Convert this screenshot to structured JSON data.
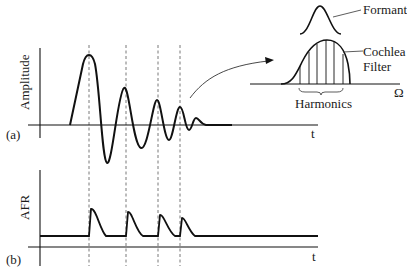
{
  "panels": {
    "a": {
      "tag": "(a)",
      "ylabel": "Amplitude",
      "xlabel": "t",
      "description": "Damped oscillating waveform (decaying sinusoid)"
    },
    "b": {
      "tag": "(b)",
      "ylabel": "AFR",
      "xlabel": "t",
      "description": "Pulse train of decaying spikes aligned with waveform peaks"
    }
  },
  "inset": {
    "formant_label": "Formant",
    "cochlea_label_line1": "Cochlea",
    "cochlea_label_line2": "Filter",
    "harmonics_label": "Harmonics",
    "axis_label": "Ω",
    "harmonic_line_count": 6
  },
  "guides": {
    "dashed_line_count": 4,
    "style": "dashed vertical lines linking waveform peaks to AFR pulses"
  },
  "colors": {
    "stroke": "#111111",
    "dashed": "#555555",
    "background": "#ffffff"
  }
}
